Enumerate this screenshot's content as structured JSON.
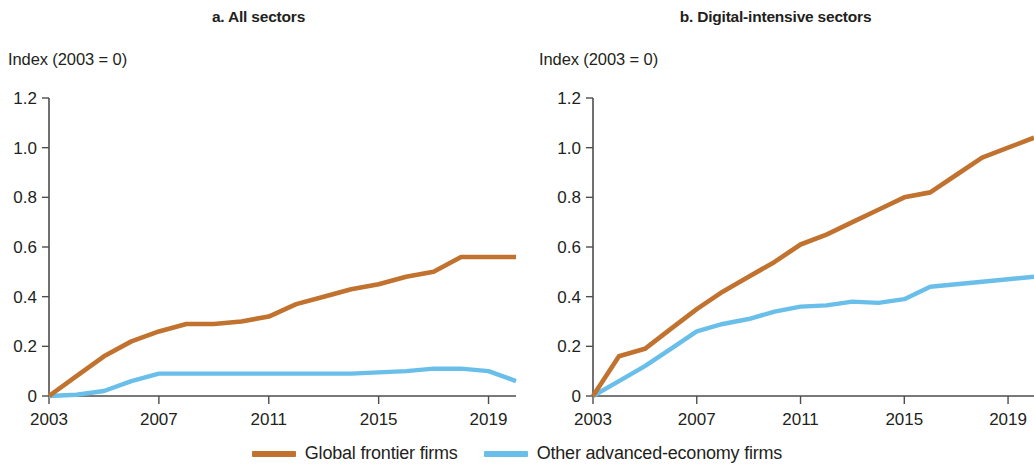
{
  "figure": {
    "panels": [
      {
        "id": "a",
        "title": "a. All sectors",
        "axis_label": "Index (2003 = 0)"
      },
      {
        "id": "b",
        "title": "b. Digital-intensive sectors",
        "axis_label": "Index (2003 = 0)"
      }
    ]
  },
  "legend": {
    "entries": [
      {
        "label": "Global frontier firms",
        "color": "#c1722f"
      },
      {
        "label": "Other advanced-economy firms",
        "color": "#69bfea"
      }
    ]
  },
  "axis": {
    "y_ticks": [
      "1.2",
      "1.0",
      "0.8",
      "0.6",
      "0.4",
      "0.2",
      "0"
    ],
    "x_ticks": [
      "2003",
      "2007",
      "2011",
      "2015",
      "2019"
    ]
  },
  "chart_data": [
    {
      "type": "line",
      "title": "a. All sectors",
      "xlabel": "",
      "ylabel": "Index (2003 = 0)",
      "xlim": [
        2003,
        2020
      ],
      "ylim": [
        0,
        1.2
      ],
      "yticks": [
        0,
        0.2,
        0.4,
        0.6,
        0.8,
        1.0,
        1.2
      ],
      "xticks": [
        2003,
        2007,
        2011,
        2015,
        2019
      ],
      "grid": false,
      "legend_position": "bottom",
      "x": [
        2003,
        2004,
        2005,
        2006,
        2007,
        2008,
        2009,
        2010,
        2011,
        2012,
        2013,
        2014,
        2015,
        2016,
        2017,
        2018,
        2019,
        2020
      ],
      "series": [
        {
          "name": "Global frontier firms",
          "color": "#c1722f",
          "values": [
            0.0,
            0.08,
            0.16,
            0.22,
            0.26,
            0.29,
            0.29,
            0.3,
            0.32,
            0.37,
            0.4,
            0.43,
            0.45,
            0.48,
            0.5,
            0.56,
            0.56,
            0.56
          ]
        },
        {
          "name": "Other advanced-economy firms",
          "color": "#69bfea",
          "values": [
            0.0,
            0.005,
            0.02,
            0.06,
            0.09,
            0.09,
            0.09,
            0.09,
            0.09,
            0.09,
            0.09,
            0.09,
            0.095,
            0.1,
            0.11,
            0.11,
            0.1,
            0.06
          ]
        }
      ]
    },
    {
      "type": "line",
      "title": "b. Digital-intensive sectors",
      "xlabel": "",
      "ylabel": "Index (2003 = 0)",
      "xlim": [
        2003,
        2020
      ],
      "ylim": [
        0,
        1.2
      ],
      "yticks": [
        0,
        0.2,
        0.4,
        0.6,
        0.8,
        1.0,
        1.2
      ],
      "xticks": [
        2003,
        2007,
        2011,
        2015,
        2019
      ],
      "grid": false,
      "legend_position": "bottom",
      "x": [
        2003,
        2004,
        2005,
        2006,
        2007,
        2008,
        2009,
        2010,
        2011,
        2012,
        2013,
        2014,
        2015,
        2016,
        2017,
        2018,
        2019,
        2020
      ],
      "series": [
        {
          "name": "Global frontier firms",
          "color": "#c1722f",
          "values": [
            0.0,
            0.16,
            0.19,
            0.27,
            0.35,
            0.42,
            0.48,
            0.54,
            0.61,
            0.65,
            0.7,
            0.75,
            0.8,
            0.82,
            0.89,
            0.96,
            1.0,
            1.04
          ]
        },
        {
          "name": "Other advanced-economy firms",
          "color": "#69bfea",
          "values": [
            0.0,
            0.06,
            0.12,
            0.19,
            0.26,
            0.29,
            0.31,
            0.34,
            0.36,
            0.365,
            0.38,
            0.375,
            0.39,
            0.44,
            0.45,
            0.46,
            0.47,
            0.48
          ]
        }
      ]
    }
  ]
}
